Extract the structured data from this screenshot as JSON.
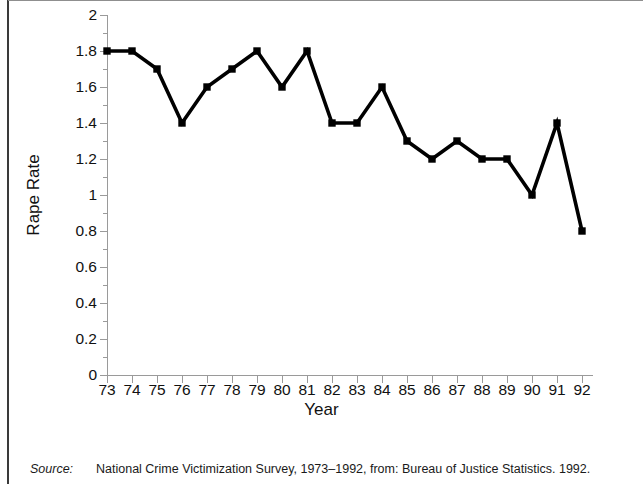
{
  "chart_data": {
    "type": "line",
    "title": "",
    "xlabel": "Year",
    "ylabel": "Rape Rate",
    "categories": [
      "73",
      "74",
      "75",
      "76",
      "77",
      "78",
      "79",
      "80",
      "81",
      "82",
      "83",
      "84",
      "85",
      "86",
      "87",
      "88",
      "89",
      "90",
      "91",
      "92"
    ],
    "values": [
      1.8,
      1.8,
      1.7,
      1.4,
      1.6,
      1.7,
      1.8,
      1.6,
      1.8,
      1.4,
      1.4,
      1.6,
      1.3,
      1.2,
      1.3,
      1.2,
      1.2,
      1.0,
      1.4,
      0.8
    ],
    "ylim": [
      0,
      2
    ],
    "ytick_labels": [
      "0",
      "0.2",
      "0.4",
      "0.6",
      "0.8",
      "1",
      "1.2",
      "1.4",
      "1.6",
      "1.8",
      "2"
    ],
    "ytick_values": [
      0,
      0.2,
      0.4,
      0.6,
      0.8,
      1,
      1.2,
      1.4,
      1.6,
      1.8,
      2
    ],
    "grid": false,
    "legend": "none",
    "marker": "square",
    "line_color": "#000000",
    "marker_color": "#000000",
    "axis_color": "#9a9a9a"
  },
  "source": {
    "label": "Source:",
    "text": "National Crime Victimization Survey, 1973–1992, from: Bureau of Justice Statistics. 1992."
  }
}
